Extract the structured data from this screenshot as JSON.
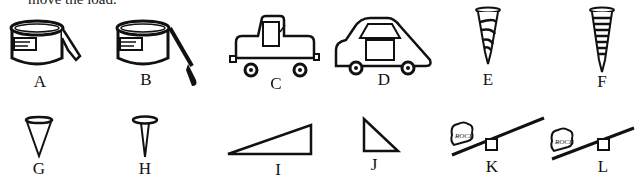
{
  "header": {
    "cut_text": "move the load."
  },
  "figures": [
    {
      "id": "A",
      "label": "A",
      "description": "paint can with lid lever (short)"
    },
    {
      "id": "B",
      "label": "B",
      "description": "paint can with screwdriver lever (long)"
    },
    {
      "id": "C",
      "label": "C",
      "description": "boxy car"
    },
    {
      "id": "D",
      "label": "D",
      "description": "streamlined car"
    },
    {
      "id": "E",
      "label": "E",
      "description": "screw with widely spaced threads"
    },
    {
      "id": "F",
      "label": "F",
      "description": "screw with closely spaced threads"
    },
    {
      "id": "G",
      "label": "G",
      "description": "wide wedge / tack"
    },
    {
      "id": "H",
      "label": "H",
      "description": "narrow wedge / tack"
    },
    {
      "id": "I",
      "label": "I",
      "description": "long gentle ramp"
    },
    {
      "id": "J",
      "label": "J",
      "description": "short steep ramp"
    },
    {
      "id": "K",
      "label": "K",
      "rock_text": "ROCK",
      "description": "lever with fulcrum far from rock"
    },
    {
      "id": "L",
      "label": "L",
      "rock_text": "ROCK",
      "description": "lever with fulcrum near rock"
    }
  ]
}
